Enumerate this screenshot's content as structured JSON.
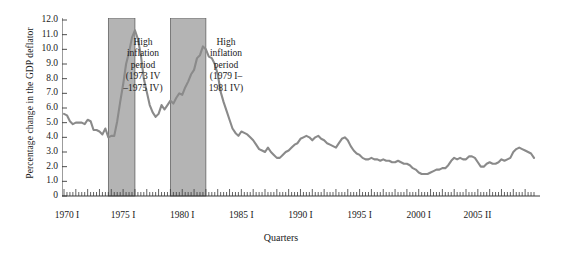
{
  "chart_data": {
    "type": "line",
    "title": "",
    "xlabel": "Quarters",
    "ylabel": "Percentage change in the GDP deflator",
    "ylim": [
      0,
      12.0
    ],
    "xlim": [
      "1970 I",
      "2005 II"
    ],
    "grid": false,
    "legend": null,
    "y_ticks": [
      "12.0",
      "11.0",
      "10.0",
      "9.0",
      "8.0",
      "7.0",
      "6.0",
      "5.0",
      "4.0",
      "3.0",
      "2.0",
      "1.0",
      "0"
    ],
    "y_tick_values": [
      12.0,
      11.0,
      10.0,
      9.0,
      8.0,
      7.0,
      6.0,
      5.0,
      4.0,
      3.0,
      2.0,
      1.0,
      0
    ],
    "x_ticks": [
      "1970 I",
      "1975 I",
      "1980 I",
      "1985 I",
      "1990 I",
      "1995 I",
      "2000 I",
      "2005 II"
    ],
    "x_tick_years": [
      1970,
      1975,
      1980,
      1985,
      1990,
      1995,
      2000,
      2005.25
    ],
    "line_color": "#8a8a8a",
    "band_color": "#b4b4b4",
    "minor_tick_interval_quarters": 1,
    "shaded_bands": [
      {
        "label": "High inflation period (1973 IV-1975 IV)",
        "start": 1973.75,
        "end": 1976.0
      },
      {
        "label": "High inflation period (1979 I-1981 IV)",
        "start": 1979.0,
        "end": 1982.0
      }
    ],
    "x_start": 1970.0,
    "x_step": 0.25,
    "values": [
      5.6,
      5.5,
      5.1,
      4.9,
      5.0,
      5.0,
      5.0,
      4.9,
      5.2,
      5.1,
      4.5,
      4.5,
      4.4,
      4.2,
      4.6,
      4.0,
      4.1,
      4.1,
      5.1,
      6.4,
      7.6,
      9.0,
      9.8,
      10.8,
      11.3,
      10.7,
      9.6,
      8.0,
      7.1,
      6.2,
      5.7,
      5.4,
      5.6,
      6.2,
      5.9,
      6.2,
      6.5,
      6.3,
      6.7,
      7.0,
      6.9,
      7.4,
      7.8,
      8.3,
      8.6,
      9.4,
      9.6,
      10.2,
      10.0,
      9.5,
      9.4,
      9.0,
      8.3,
      7.1,
      6.4,
      5.8,
      5.2,
      4.6,
      4.3,
      4.1,
      4.4,
      4.3,
      4.2,
      4.0,
      3.8,
      3.5,
      3.2,
      3.1,
      3.0,
      3.3,
      3.0,
      2.8,
      2.6,
      2.6,
      2.8,
      3.0,
      3.1,
      3.3,
      3.5,
      3.6,
      3.9,
      4.0,
      4.1,
      4.0,
      3.8,
      4.0,
      4.1,
      3.9,
      3.8,
      3.6,
      3.5,
      3.4,
      3.3,
      3.6,
      3.9,
      4.0,
      3.8,
      3.4,
      3.1,
      2.9,
      2.8,
      2.6,
      2.5,
      2.5,
      2.6,
      2.5,
      2.5,
      2.4,
      2.5,
      2.4,
      2.4,
      2.3,
      2.3,
      2.4,
      2.3,
      2.2,
      2.2,
      2.1,
      1.9,
      1.8,
      1.6,
      1.5,
      1.5,
      1.5,
      1.6,
      1.7,
      1.8,
      1.8,
      1.9,
      1.9,
      2.1,
      2.4,
      2.6,
      2.5,
      2.6,
      2.5,
      2.5,
      2.7,
      2.7,
      2.6,
      2.3,
      2.0,
      2.0,
      2.2,
      2.3,
      2.2,
      2.2,
      2.3,
      2.5,
      2.4,
      2.5,
      2.6,
      3.0,
      3.2,
      3.3,
      3.2,
      3.1,
      3.0,
      2.9,
      2.6
    ]
  },
  "annotations": {
    "band1": "High\ninflation\nperiod\n(1973 IV\n–1975 IV)",
    "band2": "High\ninflation\nperiod\n(1979 I–\n1981 IV)"
  },
  "axis": {
    "ylabel": "Percentage change in the GDP deflator",
    "xlabel": "Quarters"
  }
}
